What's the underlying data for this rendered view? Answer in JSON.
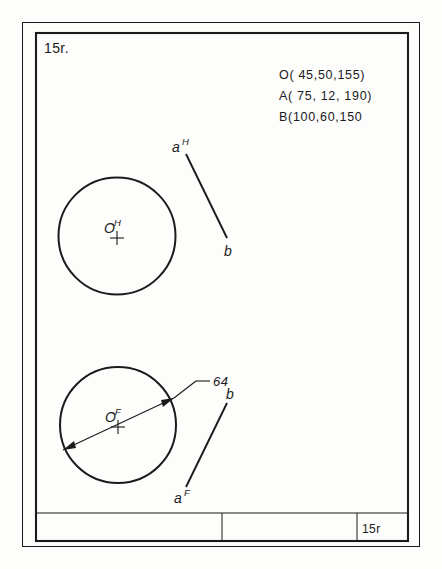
{
  "sheet": {
    "number": "15r.",
    "title_block_number": "15r"
  },
  "coordinates": {
    "lines": [
      "O( 45,50,155)",
      "A( 75, 12, 190)",
      "B(100,60,150"
    ]
  },
  "top_view": {
    "circle_center_label": "O",
    "circle_center_superscript": "H",
    "segment_start_label": "a",
    "segment_start_superscript": "H",
    "segment_end_label": "b"
  },
  "front_view": {
    "circle_center_label": "O",
    "circle_center_superscript": "F",
    "diameter_dimension": "64",
    "segment_start_label": "a",
    "segment_start_superscript": "F",
    "segment_end_label": "b"
  },
  "colors": {
    "ink": "#1b1b1b",
    "paper": "#fdfdfb"
  }
}
